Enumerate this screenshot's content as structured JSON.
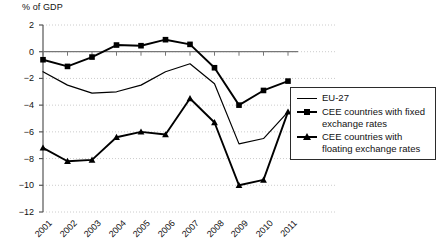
{
  "chart_data": {
    "type": "line",
    "title": "",
    "subtitle": "",
    "ylabel": "% of GDP",
    "xlabel": "",
    "ylim": [
      -12,
      2
    ],
    "ytick_step": 2,
    "yticks": [
      2,
      0,
      -2,
      -4,
      -6,
      -8,
      -10,
      -12
    ],
    "ytick_labels": [
      "2",
      "0",
      "−2",
      "−4",
      "−6",
      "−8",
      "−10",
      "−12"
    ],
    "grid": true,
    "grid_style": "dotted-horizontal",
    "legend_position": "right-middle",
    "categories": [
      "2001",
      "2002",
      "2003",
      "2004",
      "2005",
      "2006",
      "2007",
      "2008",
      "2009",
      "2010",
      "2011"
    ],
    "x": [
      2001,
      2002,
      2003,
      2004,
      2005,
      2006,
      2007,
      2008,
      2009,
      2010,
      2011
    ],
    "series": [
      {
        "name": "EU-27",
        "marker": "none",
        "color": "#000000",
        "values": [
          -1.5,
          -2.5,
          -3.1,
          -3.0,
          -2.5,
          -1.5,
          -0.9,
          -2.4,
          -6.9,
          -6.5,
          -4.5
        ]
      },
      {
        "name": "CEE countries with fixed exchange rates",
        "marker": "square",
        "color": "#000000",
        "values": [
          -0.6,
          -1.1,
          -0.4,
          0.5,
          0.45,
          0.9,
          0.55,
          -1.2,
          -4.0,
          -2.9,
          -2.2
        ]
      },
      {
        "name": "CEE countries with floating exchange rates",
        "marker": "triangle",
        "color": "#000000",
        "values": [
          -7.2,
          -8.2,
          -8.1,
          -6.4,
          -6.0,
          -6.2,
          -3.5,
          -5.3,
          -10.0,
          -9.6,
          -4.5
        ]
      }
    ]
  },
  "legend": {
    "entries": [
      {
        "label": "EU-27",
        "symbol": "line-plain"
      },
      {
        "label": "CEE countries with fixed exchange rates",
        "symbol": "line-square"
      },
      {
        "label": "CEE countries with floating exchange rates",
        "symbol": "line-triangle"
      }
    ]
  },
  "colors": {
    "ink": "#000000",
    "axis": "#555555",
    "grid": "#cccccc",
    "background": "#ffffff"
  }
}
